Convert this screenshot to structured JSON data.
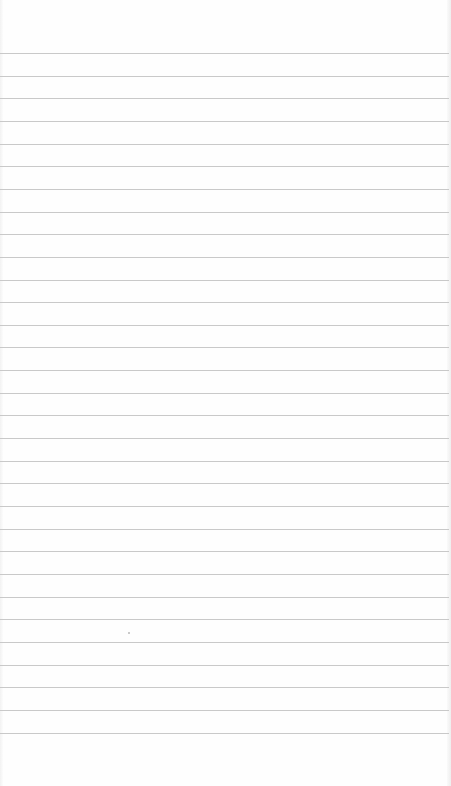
{
  "paper": {
    "type": "lined-paper",
    "background_color": "#fefefe",
    "line_color": "#c9c9c9",
    "first_line_y": 53,
    "line_spacing": 22.65,
    "line_count": 31,
    "marks": [
      {
        "x": 128,
        "y": 632
      }
    ]
  }
}
